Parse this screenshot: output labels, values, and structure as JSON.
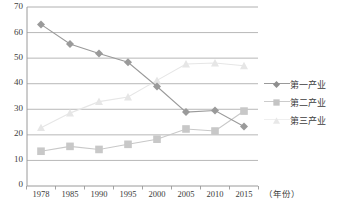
{
  "chart_data": {
    "type": "line",
    "title": "",
    "xlabel": "（年份）",
    "ylabel": "",
    "categories": [
      "1978",
      "1985",
      "1990",
      "1995",
      "2000",
      "2005",
      "2010",
      "2015"
    ],
    "ylim": [
      0,
      70
    ],
    "ytick_values": [
      0,
      10,
      20,
      30,
      40,
      50,
      60,
      70
    ],
    "ytick_labels": [
      "0",
      "10",
      "20",
      "30",
      "40",
      "50",
      "60",
      "70"
    ],
    "grid": true,
    "legend_position": "right",
    "series": [
      {
        "name": "第一产业",
        "marker": "diamond",
        "color": "#9a9a9a",
        "values": [
          63.2,
          55.5,
          51.8,
          48.4,
          38.9,
          28.9,
          29.5,
          23.3
        ]
      },
      {
        "name": "第二产业",
        "marker": "square",
        "color": "#c8c8c8",
        "values": [
          13.6,
          15.5,
          14.3,
          16.3,
          18.3,
          22.3,
          21.5,
          29.3
        ]
      },
      {
        "name": "第三产业",
        "marker": "triangle",
        "color": "#e6e6e6",
        "values": [
          22.8,
          28.5,
          33.0,
          34.8,
          41.3,
          47.7,
          48.1,
          47.0
        ]
      }
    ]
  },
  "legend": {
    "items": [
      {
        "label": "第一产业"
      },
      {
        "label": "第二产业"
      },
      {
        "label": "第三产业"
      }
    ]
  },
  "axis": {
    "x_unit_label": "（年份）"
  },
  "colors": {
    "series1": "#9a9a9a",
    "series2": "#c8c8c8",
    "series3": "#e6e6e6",
    "grid": "#b0b0b0",
    "axis": "#9a9a9a",
    "text": "#3d3d3d",
    "background": "#ffffff"
  }
}
